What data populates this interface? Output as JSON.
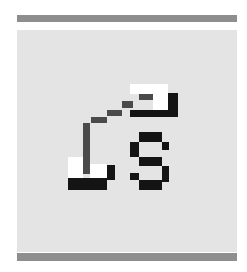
{
  "icon": {
    "name": "ls-link-icon",
    "label": "LS",
    "colors": {
      "panel": "#e4e4e4",
      "bar": "#8e8e8e",
      "black": "#141414",
      "dark_gray": "#4a4a4a",
      "white": "#ffffff"
    }
  }
}
